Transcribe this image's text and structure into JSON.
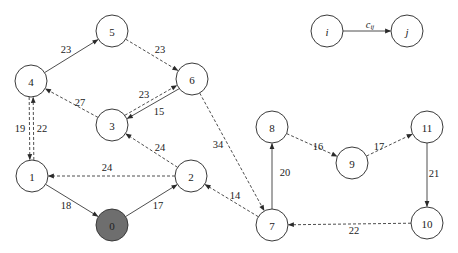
{
  "diagram": {
    "type": "directed-weighted-graph",
    "radius": 16,
    "colors": {
      "stroke": "#3a3a3a",
      "filled_node": "#6e6e6e",
      "background": "#ffffff"
    },
    "nodes": [
      {
        "id": "0",
        "label": "0",
        "x": 112,
        "y": 225,
        "filled": true
      },
      {
        "id": "1",
        "label": "1",
        "x": 32,
        "y": 176
      },
      {
        "id": "2",
        "label": "2",
        "x": 191,
        "y": 176
      },
      {
        "id": "3",
        "label": "3",
        "x": 112,
        "y": 125
      },
      {
        "id": "4",
        "label": "4",
        "x": 31,
        "y": 81
      },
      {
        "id": "5",
        "label": "5",
        "x": 112,
        "y": 31
      },
      {
        "id": "6",
        "label": "6",
        "x": 192,
        "y": 79
      },
      {
        "id": "7",
        "label": "7",
        "x": 272,
        "y": 225
      },
      {
        "id": "8",
        "label": "8",
        "x": 272,
        "y": 127
      },
      {
        "id": "9",
        "label": "9",
        "x": 352,
        "y": 163
      },
      {
        "id": "10",
        "label": "10",
        "x": 427,
        "y": 223
      },
      {
        "id": "11",
        "label": "11",
        "x": 427,
        "y": 127
      }
    ],
    "edges": [
      {
        "from": "4",
        "to": "5",
        "weight": "23",
        "style": "solid",
        "lx": 66,
        "ly": 49
      },
      {
        "from": "5",
        "to": "6",
        "weight": "23",
        "style": "dashed",
        "lx": 160,
        "ly": 49
      },
      {
        "from": "3",
        "to": "4",
        "weight": "27",
        "style": "dashed",
        "lx": 80,
        "ly": 102
      },
      {
        "from": "6",
        "to": "3",
        "weight": "23",
        "style": "solid",
        "lx": 144,
        "ly": 94,
        "offset": -2
      },
      {
        "from": "3",
        "to": "6",
        "weight": "15",
        "style": "dashed",
        "lx": 159,
        "ly": 111,
        "offset": -2
      },
      {
        "from": "1",
        "to": "4",
        "weight": "19",
        "style": "dashed",
        "lx": 20,
        "ly": 128,
        "offset": 2
      },
      {
        "from": "4",
        "to": "1",
        "weight": "22",
        "style": "dashed",
        "lx": 42,
        "ly": 128,
        "offset": 2
      },
      {
        "from": "2",
        "to": "3",
        "weight": "24",
        "style": "dashed",
        "lx": 160,
        "ly": 147
      },
      {
        "from": "2",
        "to": "1",
        "weight": "24",
        "style": "dashed",
        "lx": 107,
        "ly": 167
      },
      {
        "from": "1",
        "to": "0",
        "weight": "18",
        "style": "solid",
        "lx": 66,
        "ly": 205
      },
      {
        "from": "0",
        "to": "2",
        "weight": "17",
        "style": "solid",
        "lx": 158,
        "ly": 205
      },
      {
        "from": "6",
        "to": "7",
        "weight": "34",
        "style": "dashed",
        "lx": 218,
        "ly": 144
      },
      {
        "from": "7",
        "to": "2",
        "weight": "14",
        "style": "dashed",
        "lx": 235,
        "ly": 195
      },
      {
        "from": "7",
        "to": "8",
        "weight": "20",
        "style": "solid",
        "lx": 285,
        "ly": 172
      },
      {
        "from": "8",
        "to": "9",
        "weight": "16",
        "style": "dashed",
        "lx": 318,
        "ly": 146
      },
      {
        "from": "9",
        "to": "11",
        "weight": "17",
        "style": "dashed",
        "lx": 379,
        "ly": 146
      },
      {
        "from": "11",
        "to": "10",
        "weight": "21",
        "style": "solid",
        "lx": 434,
        "ly": 173
      },
      {
        "from": "10",
        "to": "7",
        "weight": "22",
        "style": "dashed",
        "lx": 354,
        "ly": 230
      }
    ],
    "legend": {
      "from": {
        "label": "i",
        "x": 327,
        "y": 31
      },
      "to": {
        "label": "j",
        "x": 407,
        "y": 31
      },
      "edge_label": "c",
      "edge_label_sub": "ij",
      "lx": 370,
      "ly": 24
    }
  }
}
